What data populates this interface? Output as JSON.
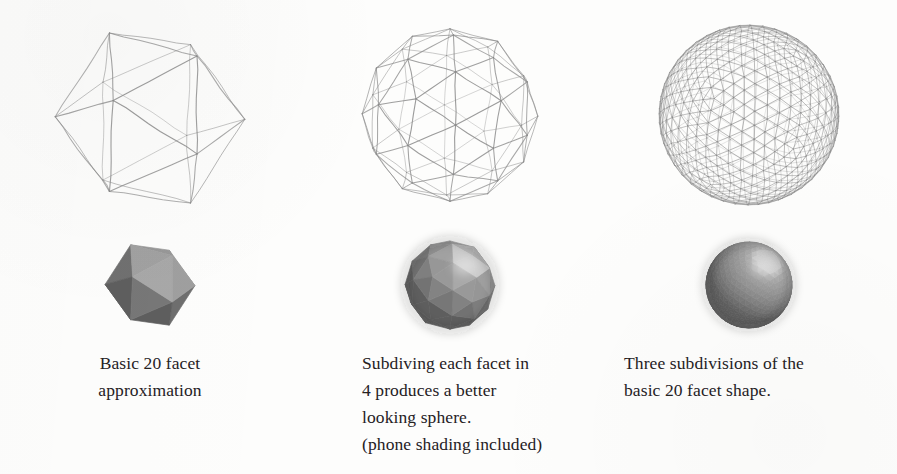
{
  "figure": {
    "background_color": "#fdfdfc",
    "ink_color": "#25211f",
    "wire_color": "#8a8a8a",
    "solid_light_gray": "#9a9a9a",
    "solid_mid_gray": "#7d7d7d",
    "solid_dark_gray": "#5e5e5e"
  },
  "columns": [
    {
      "id": "col-basic-20-facet",
      "wireframe": {
        "name": "icosahedron-wireframe",
        "subdivisions": 0,
        "face_count": 20,
        "vertex_count": 12,
        "edge_count": 30
      },
      "solid": {
        "name": "icosahedron-shaded-solid",
        "shading": "flat",
        "face_count": 20
      },
      "caption_lines": [
        "Basic 20 facet",
        "approximation"
      ],
      "caption_align": "center"
    },
    {
      "id": "col-one-subdivision",
      "wireframe": {
        "name": "geodesic-sphere-wireframe-1",
        "subdivisions": 1,
        "face_count": 80,
        "vertex_count": 42,
        "edge_count": 120
      },
      "solid": {
        "name": "geodesic-sphere-shaded-solid-1",
        "shading": "phong",
        "face_count": 80
      },
      "caption_lines": [
        "Subdiving each facet in",
        "4 produces a better",
        "looking sphere.",
        "(phone shading included)"
      ],
      "caption_align": "left"
    },
    {
      "id": "col-three-subdivisions",
      "wireframe": {
        "name": "geodesic-sphere-wireframe-3",
        "subdivisions": 3,
        "face_count": 1280,
        "vertex_count": 642,
        "edge_count": 1920
      },
      "solid": {
        "name": "geodesic-sphere-shaded-solid-3",
        "shading": "phong",
        "face_count": 1280
      },
      "caption_lines": [
        "Three subdivisions of the",
        "basic 20 facet shape."
      ],
      "caption_align": "left"
    }
  ]
}
